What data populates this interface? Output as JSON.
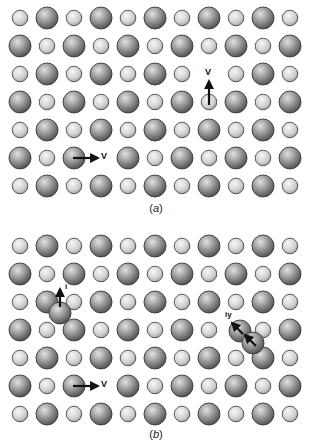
{
  "figure": {
    "colors": {
      "background": "#ffffff",
      "large_atom_light": "#d8d8d8",
      "large_atom_dark": "#4a4a4a",
      "small_atom_light": "#f2f2f2",
      "small_atom_dark": "#9a9a9a",
      "outline": "#3a3a3a",
      "arrow": "#111111"
    },
    "lattice": {
      "columns": 11,
      "rows": 7,
      "first_row_starts_with": "small",
      "atom_types": [
        "large",
        "small"
      ]
    },
    "panels": [
      {
        "id": "a",
        "caption": "(a)",
        "caption_letter": "a",
        "vacancies": [
          {
            "row": 3,
            "col": 8,
            "label": "V",
            "note": "vacancy (missing large atom) filled by small atom moving up"
          },
          {
            "row": 6,
            "col": 4,
            "label": "V",
            "note": "vacancy (missing small atom) filled by large atom moving right"
          }
        ],
        "moves": [
          {
            "from_row": 4,
            "from_col": 8,
            "direction": "up",
            "label": "V"
          },
          {
            "from_row": 6,
            "from_col": 3,
            "direction": "right",
            "label": "V"
          }
        ],
        "interstitials": []
      },
      {
        "id": "b",
        "caption": "(b)",
        "caption_letter": "b",
        "vacancies": [
          {
            "row": 6,
            "col": 4,
            "label": "V",
            "note": "vacancy (missing small atom)"
          }
        ],
        "moves": [
          {
            "from_row": 6,
            "from_col": 3,
            "direction": "right",
            "label": "V"
          }
        ],
        "interstitials": [
          {
            "type": "interstitial",
            "label": "i",
            "between_rows": [
              3,
              4
            ],
            "between_cols": [
              2,
              3
            ],
            "direction": "up"
          },
          {
            "type": "split-interstitial (dumbbell)",
            "label": "iy",
            "row": 4,
            "col": 9,
            "direction": "up-left"
          }
        ]
      }
    ],
    "labels": {
      "vacancy": "V",
      "interstitial": "i",
      "split_interstitial": "iy"
    }
  }
}
